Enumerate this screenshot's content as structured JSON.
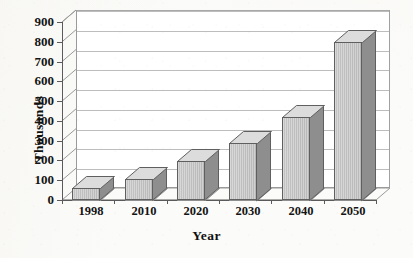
{
  "chart_data": {
    "type": "bar",
    "title": "",
    "subtitle": "",
    "xlabel": "Year",
    "ylabel": "Thousands",
    "categories": [
      "1998",
      "2010",
      "2020",
      "2030",
      "2040",
      "2050"
    ],
    "values": [
      60,
      105,
      195,
      290,
      420,
      800
    ],
    "series": [
      {
        "name": "Thousands",
        "values": [
          60,
          105,
          195,
          290,
          420,
          800
        ]
      }
    ],
    "ylim": [
      0,
      900
    ],
    "ytick_step": 100,
    "ytick_labels": [
      "0",
      "100",
      "200",
      "300",
      "400",
      "500",
      "600",
      "700",
      "800",
      "900"
    ],
    "xtick_labels": [
      "1998",
      "2010",
      "2020",
      "2030",
      "2040",
      "2050"
    ],
    "grid": true,
    "grid_axis": "y",
    "legend": false,
    "legend_position": "none",
    "three_d": true,
    "style": "grayscale-scanned-excel-3d-column",
    "annotations": []
  },
  "axes": {
    "y_title": "Thousands",
    "x_title": "Year"
  },
  "colors": {
    "bar_front": "#c4c4c4",
    "bar_side": "#8e8e8e",
    "bar_top": "#dcdcdc",
    "bar_outline": "#5f5f5f",
    "grid": "#bdbdbd",
    "axis": "#5a5a5a",
    "plot_background": "#ffffff",
    "page_background": "#fbfbf9",
    "text": "#141414"
  }
}
